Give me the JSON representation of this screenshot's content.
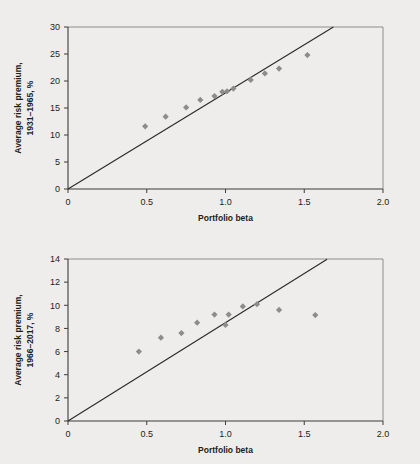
{
  "figure": {
    "background_color": "#eeedeb",
    "marker_color": "#8d8c8c",
    "line_color": "#2b2b2b",
    "axis_color": "#3d3d3d"
  },
  "chart_data": [
    {
      "type": "scatter",
      "title": "",
      "xlabel": "Portfolio beta",
      "ylabel": "Average risk premium, 1931–1965, %",
      "ylabel_line1": "Average risk premium,",
      "ylabel_line2": "1931–1965, %",
      "xlim": [
        0,
        2.0
      ],
      "ylim": [
        0,
        30
      ],
      "xticks": [
        0,
        0.5,
        1.0,
        1.5,
        2.0
      ],
      "xticklabels": [
        "0",
        "0.5",
        "1.0",
        "1.5",
        "2.0"
      ],
      "yticks": [
        0,
        5,
        10,
        15,
        20,
        25,
        30
      ],
      "yticklabels": [
        "0",
        "5",
        "10",
        "15",
        "20",
        "25",
        "30"
      ],
      "grid": false,
      "legend": "none",
      "series": [
        {
          "name": "Portfolio average risk premium",
          "marker": "diamond",
          "color": "#8d8c8c",
          "points": [
            {
              "x": 0.49,
              "y": 11.6
            },
            {
              "x": 0.62,
              "y": 13.4
            },
            {
              "x": 0.75,
              "y": 15.1
            },
            {
              "x": 0.84,
              "y": 16.5
            },
            {
              "x": 0.93,
              "y": 17.2
            },
            {
              "x": 0.98,
              "y": 18.0
            },
            {
              "x": 1.01,
              "y": 18.1
            },
            {
              "x": 1.05,
              "y": 18.6
            },
            {
              "x": 1.16,
              "y": 20.2
            },
            {
              "x": 1.25,
              "y": 21.4
            },
            {
              "x": 1.34,
              "y": 22.3
            },
            {
              "x": 1.52,
              "y": 24.8
            }
          ]
        }
      ],
      "fit_line": {
        "name": "Security market line",
        "intercept": 0,
        "slope": 17.8,
        "x_start": 0,
        "x_end": 1.685,
        "color": "#2b2b2b"
      }
    },
    {
      "type": "scatter",
      "title": "",
      "xlabel": "Portfolio beta",
      "ylabel": "Average risk premium, 1966–2017, %",
      "ylabel_line1": "Average risk premium,",
      "ylabel_line2": "1966–2017, %",
      "xlim": [
        0,
        2.0
      ],
      "ylim": [
        0,
        14
      ],
      "xticks": [
        0,
        0.5,
        1.0,
        1.5,
        2.0
      ],
      "xticklabels": [
        "0",
        "0.5",
        "1.0",
        "1.5",
        "2.0"
      ],
      "yticks": [
        0,
        2,
        4,
        6,
        8,
        10,
        12,
        14
      ],
      "yticklabels": [
        "0",
        "2",
        "4",
        "6",
        "8",
        "10",
        "12",
        "14"
      ],
      "grid": false,
      "legend": "none",
      "series": [
        {
          "name": "Portfolio average risk premium",
          "marker": "diamond",
          "color": "#8d8c8c",
          "points": [
            {
              "x": 0.45,
              "y": 6.0
            },
            {
              "x": 0.59,
              "y": 7.2
            },
            {
              "x": 0.72,
              "y": 7.6
            },
            {
              "x": 0.82,
              "y": 8.5
            },
            {
              "x": 0.93,
              "y": 9.2
            },
            {
              "x": 1.0,
              "y": 8.3
            },
            {
              "x": 1.02,
              "y": 9.2
            },
            {
              "x": 1.11,
              "y": 9.9
            },
            {
              "x": 1.2,
              "y": 10.1
            },
            {
              "x": 1.34,
              "y": 9.6
            },
            {
              "x": 1.57,
              "y": 9.15
            }
          ]
        }
      ],
      "fit_line": {
        "name": "Security market line",
        "intercept": 0,
        "slope": 8.5,
        "x_start": 0,
        "x_end": 1.645,
        "color": "#2b2b2b"
      }
    }
  ]
}
